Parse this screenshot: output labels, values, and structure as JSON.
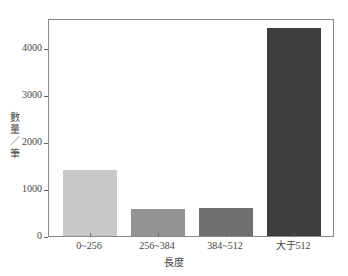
{
  "chart_data": {
    "type": "bar",
    "title": "",
    "xlabel": "長度",
    "ylabel": "數量／筆",
    "categories": [
      "0~256",
      "256~384",
      "384~512",
      "大于512"
    ],
    "values": [
      1400,
      575,
      595,
      4430
    ],
    "colors": [
      "#c8c8c8",
      "#939393",
      "#6f6f6f",
      "#3e3e3e"
    ],
    "ylim": [
      0,
      4640
    ],
    "yticks": [
      0,
      1000,
      2000,
      3000,
      4000
    ],
    "ytick_labels": [
      "0",
      "1000",
      "2000",
      "3000",
      "4000"
    ],
    "grid": false,
    "legend": null
  }
}
